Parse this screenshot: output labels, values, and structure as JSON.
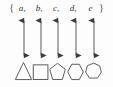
{
  "figure": {
    "background_color": "#fdfdfd",
    "stroke_color": "#5d5d5d",
    "text_color": "#333333",
    "arrow_color": "#4a4a4a"
  },
  "set": {
    "open_brace": "{",
    "close_brace": "}",
    "separator": ",",
    "members": [
      "a",
      "b",
      "c",
      "d",
      "e"
    ]
  },
  "arrows": {
    "count": 5,
    "style": "double-headed",
    "orientation": "vertical",
    "label": "two-way correspondence"
  },
  "shapes": [
    {
      "name": "triangle",
      "sides": 3,
      "label": "triangle"
    },
    {
      "name": "square",
      "sides": 4,
      "label": "square"
    },
    {
      "name": "pentagon",
      "sides": 5,
      "label": "pentagon"
    },
    {
      "name": "hexagon",
      "sides": 6,
      "label": "hexagon"
    },
    {
      "name": "heptagon",
      "sides": 7,
      "label": "heptagon"
    }
  ],
  "columns": [
    {
      "index": 0,
      "member": "a",
      "shape": "triangle",
      "center_x": 24
    },
    {
      "index": 1,
      "member": "b",
      "shape": "square",
      "center_x": 41
    },
    {
      "index": 2,
      "member": "c",
      "shape": "pentagon",
      "center_x": 58
    },
    {
      "index": 3,
      "member": "d",
      "shape": "hexagon",
      "center_x": 76
    },
    {
      "index": 4,
      "member": "e",
      "shape": "heptagon",
      "center_x": 94
    }
  ]
}
